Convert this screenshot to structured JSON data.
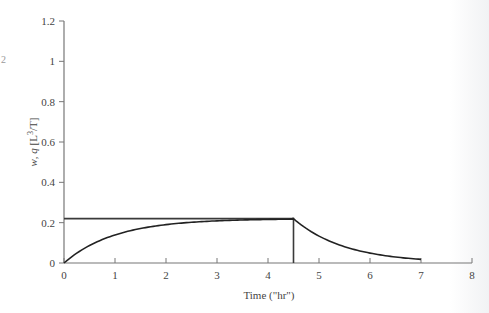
{
  "chart_data": {
    "type": "line",
    "title": "",
    "xlabel": "Time (\"hr\")",
    "ylabel": "w, q [L³/T]",
    "xlim": [
      0,
      8
    ],
    "ylim": [
      0,
      1.2
    ],
    "x_ticks": [
      "0",
      "1",
      "2",
      "3",
      "4",
      "5",
      "6",
      "7",
      "8"
    ],
    "y_ticks": [
      "0",
      "0.2",
      "0.4",
      "0.6",
      "0.8",
      "1",
      "1.2"
    ],
    "grid": false,
    "legend": null,
    "series": [
      {
        "name": "w (input rate)",
        "description": "Constant input 0.22 from t=0 to t=4.5, then drops vertically to 0",
        "x": [
          0,
          4.5,
          4.5
        ],
        "y": [
          0.22,
          0.22,
          0
        ]
      },
      {
        "name": "q (outflow)",
        "description": "Exponential rise toward 0.22 until t=4.5, then exponential recession to t=7",
        "x": [
          0,
          0.5,
          1,
          1.5,
          2,
          2.5,
          3,
          3.5,
          4,
          4.5,
          5,
          5.5,
          6,
          6.5,
          7
        ],
        "y": [
          0,
          0.087,
          0.139,
          0.171,
          0.19,
          0.202,
          0.209,
          0.213,
          0.216,
          0.218,
          0.132,
          0.08,
          0.049,
          0.03,
          0.018
        ]
      }
    ]
  },
  "labels": {
    "xlabel": "Time (\"hr\")",
    "ylabel_main": "w, q [L",
    "ylabel_sup": "3",
    "ylabel_end": "/T]",
    "edge_mark": "2"
  }
}
